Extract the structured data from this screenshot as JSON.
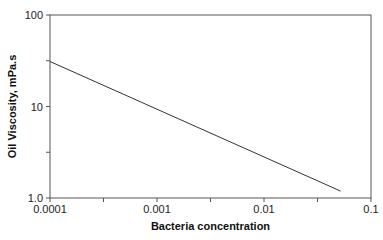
{
  "chart_data": {
    "type": "line",
    "title": "",
    "xlabel": "Bacteria concentration",
    "ylabel": "Oil Viscosity, mPa.s",
    "xscale": "log",
    "yscale": "log",
    "xlim": [
      0.0001,
      0.1
    ],
    "ylim": [
      1.0,
      100
    ],
    "xticks": [
      0.0001,
      0.001,
      0.01,
      0.1
    ],
    "xtick_labels": [
      "0.0001",
      "0.001",
      "0.01",
      "0.1"
    ],
    "yticks": [
      1.0,
      10,
      100
    ],
    "ytick_labels": [
      "1.0",
      "10",
      "100"
    ],
    "grid": false,
    "legend": null,
    "series": [
      {
        "name": "viscosity",
        "color": "#333333",
        "x": [
          0.0001,
          0.052
        ],
        "y": [
          31,
          1.19
        ]
      }
    ]
  }
}
